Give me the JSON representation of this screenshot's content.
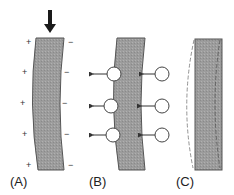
{
  "panels": [
    {
      "id": "A",
      "label": "(A)",
      "description": "Bent slab under downward force with charge distribution",
      "plus_signs": [
        "+",
        "+",
        "+",
        "+",
        "+"
      ],
      "minus_signs": [
        "−",
        "−",
        "−",
        "−",
        "−"
      ]
    },
    {
      "id": "B",
      "label": "(B)",
      "description": "Bent slab with circular particles and leftward arrows"
    },
    {
      "id": "C",
      "label": "(C)",
      "description": "Straightened slab with dashed outline of original curvature"
    }
  ],
  "colors": {
    "slab_fill": "#9a9a9a",
    "slab_stroke": "#555555",
    "arrow": "#1a1a1a",
    "circle_fill": "#ffffff",
    "circle_stroke": "#444444",
    "dashed": "#777777"
  }
}
